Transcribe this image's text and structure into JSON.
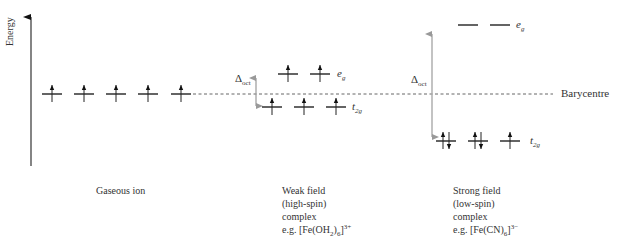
{
  "axis": {
    "label": "Energy"
  },
  "barycentre": {
    "label": "Barycentre"
  },
  "gaseous_ion": {
    "caption": "Gaseous ion",
    "orbitals": [
      {
        "electrons": "up"
      },
      {
        "electrons": "up"
      },
      {
        "electrons": "up"
      },
      {
        "electrons": "up"
      },
      {
        "electrons": "up"
      }
    ]
  },
  "weak_field": {
    "caption_lines": [
      "Weak field",
      "(high-spin)",
      "complex"
    ],
    "example_prefix": "e.g. [Fe(OH",
    "example_sub1": "2",
    "example_mid": ")",
    "example_sub2": "6",
    "example_close": "]",
    "example_charge": "3+",
    "delta_label": "Δ",
    "delta_sub": "oct",
    "eg": {
      "label": "e",
      "sub": "g",
      "electrons": [
        "up",
        "up"
      ]
    },
    "t2g": {
      "label": "t",
      "sub": "2g",
      "electrons": [
        "up",
        "up",
        "up"
      ]
    }
  },
  "strong_field": {
    "caption_lines": [
      "Strong field",
      "(low-spin)",
      "complex"
    ],
    "example_prefix": "e.g. [Fe(CN)",
    "example_sub2": "6",
    "example_close": "]",
    "example_charge": "3−",
    "delta_label": "Δ",
    "delta_sub": "oct",
    "eg": {
      "label": "e",
      "sub": "g",
      "electrons": [
        "none",
        "none"
      ]
    },
    "t2g": {
      "label": "t",
      "sub": "2g",
      "electrons": [
        "pair",
        "pair",
        "up"
      ]
    }
  }
}
